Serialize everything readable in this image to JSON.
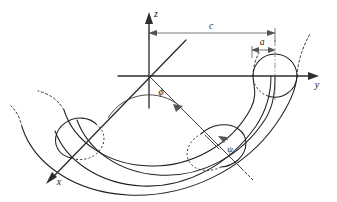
{
  "figure": {
    "background_color": "#ffffff",
    "line_color": "#1f1f1f",
    "accent_color": "#555555"
  },
  "axes": [
    {
      "id": "z",
      "label": "z",
      "direction": "up",
      "label_x": 156,
      "label_y": 17
    },
    {
      "id": "y",
      "label": "y",
      "direction": "right",
      "label_x": 317,
      "label_y": 88
    },
    {
      "id": "x",
      "label": "x",
      "direction": "down-left",
      "label_x": 59,
      "label_y": 185
    }
  ],
  "dimensions": [
    {
      "id": "c",
      "label": "c",
      "meaning": "major radius, distance from origin to tube center",
      "label_x": 211,
      "label_y": 29,
      "from_x": 149,
      "to_x": 275,
      "line_y": 33
    },
    {
      "id": "a",
      "label": "a",
      "meaning": "minor radius, radius of the tube cross-section",
      "label_x": 262,
      "label_y": 45,
      "from_x": 252,
      "to_x": 275,
      "line_y": 50
    }
  ],
  "angles": [
    {
      "id": "phi",
      "label": "ϕ",
      "meaning": "azimuthal angle measured about the z axis from the x axis",
      "label_x": 161,
      "label_y": 95,
      "vertex_x": 149,
      "vertex_y": 76
    },
    {
      "id": "psi",
      "label": "ψ",
      "meaning": "angle around the tube cross-section",
      "label_x": 230,
      "label_y": 152,
      "vertex_x": 219,
      "vertex_y": 149
    }
  ],
  "cross_sections": [
    {
      "id": "right-tube-circle",
      "cx": 275,
      "cy": 76,
      "r": 22
    },
    {
      "id": "lower-right-tube-ellipse",
      "cx": 219,
      "cy": 149,
      "rx": 23,
      "ry": 18
    },
    {
      "id": "lower-left-tube-ellipse",
      "cx": 77,
      "cy": 139,
      "rx": 22,
      "ry": 19
    }
  ]
}
